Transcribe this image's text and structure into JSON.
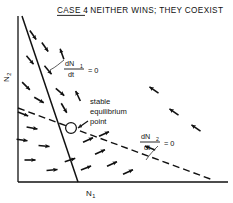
{
  "figure": {
    "title_prefix": "CASE 4",
    "title_rest": ": NEITHER WINS; THEY COEXIST",
    "title_full": "CASE 4: NEITHER WINS; THEY COEXIST"
  },
  "axes": {
    "y_label": "N",
    "y_label_sub": "2",
    "x_label": "N",
    "x_label_sub": "1",
    "x_origin": 18,
    "y_origin": 182,
    "x_end": 228,
    "y_top": 16
  },
  "annotations": {
    "isocline1": {
      "numerator": "dN",
      "numerator_sub": "1",
      "denominator": "dt",
      "equals": "= 0",
      "style": "solid"
    },
    "isocline2": {
      "numerator": "dN",
      "numerator_sub": "2",
      "denominator": "dt",
      "equals": "= 0",
      "style": "dashed"
    },
    "equilibrium": {
      "line1": "stable",
      "line2": "equilibrium",
      "line3": "point"
    }
  },
  "colors": {
    "ink": "#111111",
    "background": "#ffffff"
  },
  "chart_data": {
    "type": "line",
    "xlabel": "N1",
    "ylabel": "N2",
    "grid": false,
    "legend": "none",
    "series": [
      {
        "name": "dN1/dt = 0",
        "style": "solid",
        "x": [
          22,
          78
        ],
        "y": [
          16,
          182
        ]
      },
      {
        "name": "dN2/dt = 0",
        "style": "dashed",
        "x": [
          18,
          213
        ],
        "y": [
          108,
          180
        ]
      }
    ],
    "equilibrium_point": {
      "x": 71,
      "y": 128,
      "label": "stable equilibrium point",
      "stability": "stable"
    },
    "vectors": [
      {
        "x": 33,
        "y": 35,
        "angle": 55
      },
      {
        "x": 45,
        "y": 47,
        "angle": 55
      },
      {
        "x": 30,
        "y": 60,
        "angle": 50
      },
      {
        "x": 48,
        "y": 70,
        "angle": 50
      },
      {
        "x": 26,
        "y": 86,
        "angle": 45
      },
      {
        "x": 60,
        "y": 92,
        "angle": 40
      },
      {
        "x": 39,
        "y": 100,
        "angle": 30
      },
      {
        "x": 23,
        "y": 114,
        "angle": 20
      },
      {
        "x": 32,
        "y": 128,
        "angle": 10
      },
      {
        "x": 22,
        "y": 140,
        "angle": 8
      },
      {
        "x": 44,
        "y": 146,
        "angle": 5
      },
      {
        "x": 30,
        "y": 160,
        "angle": 0
      },
      {
        "x": 52,
        "y": 170,
        "angle": -5
      },
      {
        "x": 70,
        "y": 160,
        "angle": -18
      },
      {
        "x": 86,
        "y": 168,
        "angle": -22
      },
      {
        "x": 100,
        "y": 152,
        "angle": -25
      },
      {
        "x": 112,
        "y": 164,
        "angle": -25
      },
      {
        "x": 128,
        "y": 172,
        "angle": -25
      },
      {
        "x": 88,
        "y": 140,
        "angle": -25
      },
      {
        "x": 104,
        "y": 134,
        "angle": -25
      },
      {
        "x": 154,
        "y": 90,
        "angle": 215
      },
      {
        "x": 174,
        "y": 112,
        "angle": 215
      },
      {
        "x": 196,
        "y": 128,
        "angle": 215
      },
      {
        "x": 150,
        "y": 148,
        "angle": 200
      },
      {
        "x": 64,
        "y": 108,
        "angle": 60
      },
      {
        "x": 78,
        "y": 96,
        "angle": 245
      },
      {
        "x": 62,
        "y": 54,
        "angle": 250
      }
    ]
  }
}
